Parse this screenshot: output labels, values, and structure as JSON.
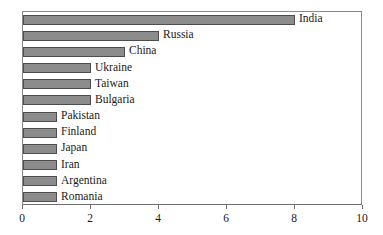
{
  "chart_data": {
    "type": "bar",
    "orientation": "horizontal",
    "title": "",
    "xlabel": "",
    "ylabel": "",
    "xlim": [
      0,
      10
    ],
    "xticks": [
      0,
      2,
      4,
      6,
      8,
      10
    ],
    "xtick_labels": [
      "0",
      "2",
      "4",
      "6",
      "8",
      "10"
    ],
    "grid": false,
    "legend": null,
    "bar_color": "#8c8c8c",
    "bar_edge_color": "#4d4d4d",
    "axis_color": "#6e6e6e",
    "categories": [
      "India",
      "Russia",
      "China",
      "Ukraine",
      "Taiwan",
      "Bulgaria",
      "Pakistan",
      "Finland",
      "Japan",
      "Iran",
      "Argentina",
      "Romania"
    ],
    "values": [
      8,
      4,
      3,
      2,
      2,
      2,
      1,
      1,
      1,
      1,
      1,
      1
    ],
    "bars": [
      {
        "label": "India",
        "value": 8
      },
      {
        "label": "Russia",
        "value": 4
      },
      {
        "label": "China",
        "value": 3
      },
      {
        "label": "Ukraine",
        "value": 2
      },
      {
        "label": "Taiwan",
        "value": 2
      },
      {
        "label": "Bulgaria",
        "value": 2
      },
      {
        "label": "Pakistan",
        "value": 1
      },
      {
        "label": "Finland",
        "value": 1
      },
      {
        "label": "Japan",
        "value": 1
      },
      {
        "label": "Iran",
        "value": 1
      },
      {
        "label": "Argentina",
        "value": 1
      },
      {
        "label": "Romania",
        "value": 1
      }
    ]
  }
}
